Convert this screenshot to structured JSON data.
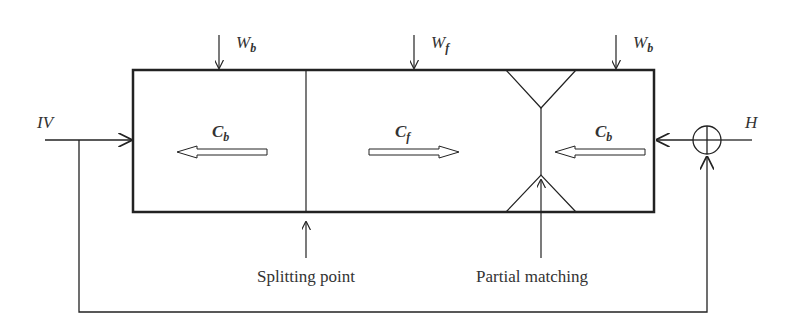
{
  "diagram": {
    "inputs": {
      "w_b_left": {
        "main": "W",
        "sub": "b"
      },
      "w_f": {
        "main": "W",
        "sub": "f"
      },
      "w_b_right": {
        "main": "W",
        "sub": "b"
      },
      "iv": "IV",
      "h": "H"
    },
    "flows": {
      "c_b_left": {
        "main": "C",
        "sub": "b"
      },
      "c_f": {
        "main": "C",
        "sub": "f"
      },
      "c_b_right": {
        "main": "C",
        "sub": "b"
      }
    },
    "annotations": {
      "splitting_point": "Splitting point",
      "partial_matching": "Partial matching"
    },
    "summing_junction": "summing-junction",
    "colors": {
      "line": "#222222",
      "text": "#333333"
    }
  }
}
